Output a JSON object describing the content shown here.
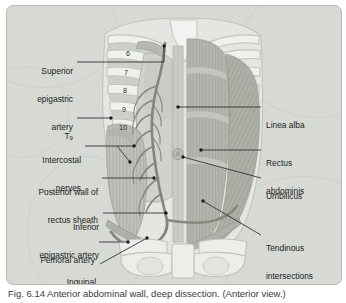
{
  "figure": {
    "panel_bg": "#d6d9d4",
    "panel_border": "#b9bdb7",
    "leader_color": "#2b2b2b",
    "caption": "Fig. 6.14 Anterior abdominal wall, deep dissection. (Anterior view.)"
  },
  "labels_left": [
    {
      "id": "superior-epigastric-artery",
      "lines": [
        "Superior",
        "epigastric",
        "artery"
      ]
    },
    {
      "id": "t9",
      "lines": [
        "T9"
      ]
    },
    {
      "id": "intercostal-nerves",
      "lines": [
        "Intercostal",
        "nerves"
      ]
    },
    {
      "id": "posterior-wall-of-rectus-sheath",
      "lines": [
        "Posterior wall of",
        "rectus sheath"
      ]
    },
    {
      "id": "inferior-epigastric-artery",
      "lines": [
        "Inferior",
        "epigastric artery"
      ]
    },
    {
      "id": "femoral-artery",
      "lines": [
        "Femoral artery"
      ]
    },
    {
      "id": "inguinal-ligament",
      "lines": [
        "Inguinal",
        "ligament"
      ]
    }
  ],
  "labels_right": [
    {
      "id": "linea-alba",
      "lines": [
        "Linea alba"
      ]
    },
    {
      "id": "rectus-abdominis",
      "lines": [
        "Rectus",
        "abdominis"
      ]
    },
    {
      "id": "umbilicus",
      "lines": [
        "Umbilicus"
      ]
    },
    {
      "id": "tendinous-intersections",
      "lines": [
        "Tendinous",
        "intersections"
      ]
    }
  ],
  "rib_numbers": [
    "6",
    "7",
    "8",
    "9",
    "10"
  ],
  "colors": {
    "bone": "#eceee9",
    "bone_edge": "#bcc0b9",
    "muscle_rectus": "#b3b6ae",
    "muscle_oblique": "#a8aca3",
    "sheath": "#c2c5bd",
    "vessel": "#8a8d85",
    "linea_alba": "#c9ccc4"
  }
}
